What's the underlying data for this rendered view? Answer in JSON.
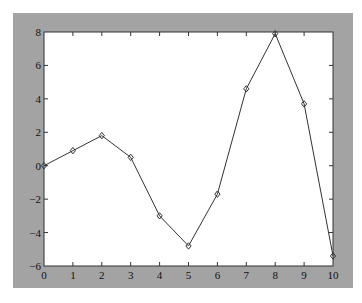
{
  "chart_data": {
    "type": "line",
    "title": "",
    "xlabel": "",
    "ylabel": "",
    "x": [
      0,
      1,
      2,
      3,
      4,
      5,
      6,
      7,
      8,
      9,
      10
    ],
    "series": [
      {
        "name": "series1",
        "marker": "diamond",
        "values": [
          0.0,
          0.9,
          1.8,
          0.5,
          -3.0,
          -4.8,
          -1.7,
          4.6,
          7.9,
          3.7,
          -5.4
        ]
      }
    ],
    "xlim": [
      0,
      10
    ],
    "ylim": [
      -6,
      8
    ],
    "xticks": [
      "0",
      "1",
      "2",
      "3",
      "4",
      "5",
      "6",
      "7",
      "8",
      "9",
      "10"
    ],
    "yticks": [
      "-6",
      "-4",
      "-2",
      "0",
      "2",
      "4",
      "6",
      "8"
    ],
    "grid": false,
    "legend": null
  },
  "colors": {
    "figure_background": "#a3a3a3",
    "axes_background": "#ffffff",
    "line": "#333333"
  }
}
